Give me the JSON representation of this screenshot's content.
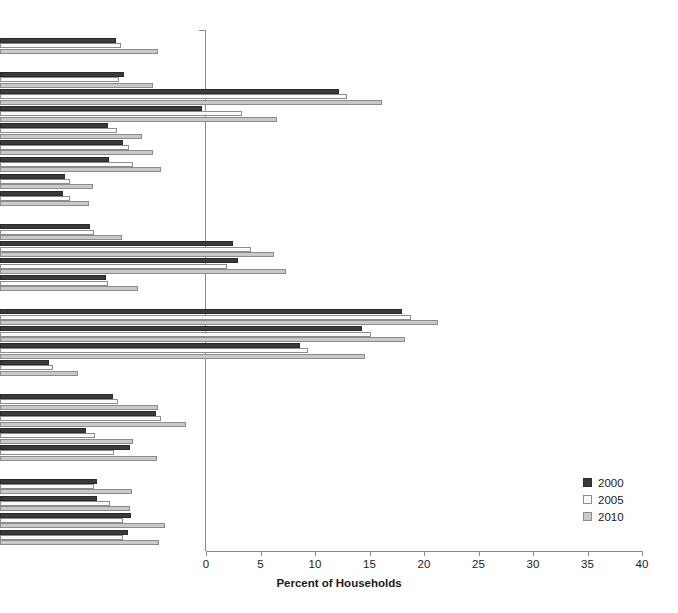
{
  "chart_data": {
    "type": "bar",
    "orientation": "horizontal",
    "title": "",
    "xlabel": "Percent of Households",
    "ylabel": "",
    "xlim": [
      0,
      40
    ],
    "xticks": [
      0,
      5,
      10,
      15,
      20,
      25,
      30,
      35,
      40
    ],
    "grid": false,
    "legend_position": "right-inside",
    "series": [
      {
        "name": "2000",
        "color": "#3a3a3a"
      },
      {
        "name": "2005",
        "color": "#fbfbfb"
      },
      {
        "name": "2010",
        "color": "#c9c9c9"
      }
    ],
    "rows": [
      {
        "label": "All Households",
        "style": "header",
        "values": [
          10.6,
          11.1,
          14.5
        ]
      },
      {
        "label": "Household Composition:",
        "style": "header",
        "values": null
      },
      {
        "label": "Married couples with children",
        "style": "plain",
        "values": [
          11.4,
          10.9,
          14.0
        ]
      },
      {
        "label": "Single women with children",
        "style": "plain",
        "values": [
          31.1,
          31.8,
          35.0
        ]
      },
      {
        "label": "Single men with children",
        "style": "plain",
        "values": [
          18.5,
          22.2,
          25.4
        ]
      },
      {
        "label": "More than one adult, no children",
        "style": "plain",
        "values": [
          9.9,
          10.7,
          13.0
        ]
      },
      {
        "label": "Women living alone",
        "style": "plain",
        "values": [
          11.3,
          11.8,
          14.0
        ]
      },
      {
        "label": "Men living alone",
        "style": "plain",
        "values": [
          10.0,
          12.2,
          14.8
        ]
      },
      {
        "label": "Households with older adults",
        "style": "plain",
        "values": [
          6.0,
          6.4,
          8.5
        ]
      },
      {
        "label": "Older adults living alone",
        "style": "plain",
        "values": [
          5.8,
          6.4,
          8.2
        ]
      },
      {
        "label": "Race/Ethnicity of Household Head:",
        "style": "header",
        "values": null
      },
      {
        "label": "White non-Hispanic",
        "style": "plain",
        "values": [
          8.3,
          8.6,
          11.2
        ]
      },
      {
        "label": "Black non-Hispanic",
        "style": "plain",
        "values": [
          21.4,
          23.0,
          25.1
        ]
      },
      {
        "label": "Hispanic",
        "style": "plain",
        "values": [
          21.8,
          20.8,
          26.2
        ]
      },
      {
        "label": "Other",
        "style": "plain",
        "values": [
          9.7,
          9.9,
          12.7
        ]
      },
      {
        "label": "Income versus Poverty Threshold:",
        "style": "header",
        "values": null
      },
      {
        "label": "Income below poverty threshold",
        "style": "plain",
        "values": [
          36.9,
          37.7,
          40.2
        ]
      },
      {
        "label": "Income < 130% of poverty threshold",
        "style": "plain",
        "values": [
          33.2,
          34.0,
          37.2
        ]
      },
      {
        "label": "Income < 185% of poverty threshold",
        "style": "plain",
        "values": [
          27.5,
          28.3,
          33.5
        ]
      },
      {
        "label": "Income ≥ 185% of poverty threshold",
        "style": "plain",
        "values": [
          4.5,
          4.9,
          7.2
        ]
      },
      {
        "label": "Area of Residence:",
        "style": "header",
        "values": null
      },
      {
        "label": "Inside metropolitan area",
        "style": "italic",
        "values": [
          10.4,
          10.8,
          14.5
        ]
      },
      {
        "label": "Inside inner city",
        "style": "plain",
        "values": [
          14.3,
          14.8,
          17.1
        ]
      },
      {
        "label": "Not inner city",
        "style": "plain",
        "values": [
          7.9,
          8.7,
          12.2
        ]
      },
      {
        "label": "Outside metropolitan area",
        "style": "italic",
        "values": [
          11.9,
          10.5,
          14.4
        ]
      },
      {
        "label": "Census Geographic Region:",
        "style": "header",
        "values": null
      },
      {
        "label": "Northeast",
        "style": "plain",
        "values": [
          8.9,
          8.6,
          12.1
        ]
      },
      {
        "label": "Midwest",
        "style": "plain",
        "values": [
          8.9,
          10.1,
          11.9
        ]
      },
      {
        "label": "South",
        "style": "plain",
        "values": [
          12.0,
          11.3,
          15.1
        ]
      },
      {
        "label": "West",
        "style": "plain",
        "values": [
          11.7,
          11.3,
          14.6
        ]
      }
    ]
  },
  "axis": {
    "xlabel": "Percent of Households",
    "tick_labels": [
      "0",
      "5",
      "10",
      "15",
      "20",
      "25",
      "30",
      "35",
      "40"
    ]
  },
  "legend": {
    "items": [
      {
        "label": "2000",
        "color": "#3a3a3a"
      },
      {
        "label": "2005",
        "color": "#fbfbfb"
      },
      {
        "label": "2010",
        "color": "#c9c9c9"
      }
    ]
  }
}
